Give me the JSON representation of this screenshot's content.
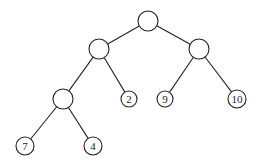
{
  "diagram": {
    "type": "binary-tree",
    "nodes": [
      {
        "id": "root",
        "label": "",
        "x": 148,
        "y": 21,
        "r": 10
      },
      {
        "id": "l1",
        "label": "",
        "x": 99,
        "y": 49,
        "r": 10
      },
      {
        "id": "r1",
        "label": "",
        "x": 199,
        "y": 49,
        "r": 10
      },
      {
        "id": "ll2",
        "label": "",
        "x": 63,
        "y": 99,
        "r": 10
      },
      {
        "id": "lr2",
        "label": "2",
        "x": 129,
        "y": 99,
        "r": 8
      },
      {
        "id": "rl2",
        "label": "9",
        "x": 165,
        "y": 99,
        "r": 8
      },
      {
        "id": "rr2",
        "label": "10",
        "x": 237,
        "y": 99,
        "r": 9
      },
      {
        "id": "lll3",
        "label": "7",
        "x": 25,
        "y": 146,
        "r": 9
      },
      {
        "id": "llr3",
        "label": "4",
        "x": 93,
        "y": 146,
        "r": 9
      }
    ],
    "edges": [
      [
        "root",
        "l1"
      ],
      [
        "root",
        "r1"
      ],
      [
        "l1",
        "ll2"
      ],
      [
        "l1",
        "lr2"
      ],
      [
        "r1",
        "rl2"
      ],
      [
        "r1",
        "rr2"
      ],
      [
        "ll2",
        "lll3"
      ],
      [
        "ll2",
        "llr3"
      ]
    ]
  }
}
